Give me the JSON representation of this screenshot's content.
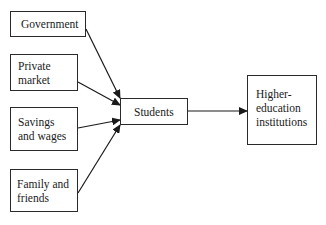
{
  "diagram": {
    "sources": [
      {
        "id": "government",
        "label": "Government"
      },
      {
        "id": "private-market",
        "label": "Private\nmarket"
      },
      {
        "id": "savings-wages",
        "label": "Savings\nand wages"
      },
      {
        "id": "family-friends",
        "label": "Family and\nfriends"
      }
    ],
    "middle": {
      "id": "students",
      "label": "Students"
    },
    "target": {
      "id": "higher-education",
      "label": "Higher-\neducation\ninstitutions"
    },
    "edges": [
      {
        "from": "government",
        "to": "students"
      },
      {
        "from": "private-market",
        "to": "students"
      },
      {
        "from": "savings-wages",
        "to": "students"
      },
      {
        "from": "family-friends",
        "to": "students"
      },
      {
        "from": "students",
        "to": "higher-education"
      }
    ]
  }
}
